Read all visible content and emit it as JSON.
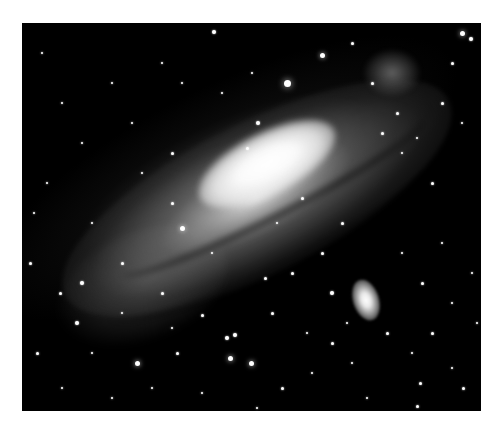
{
  "image": {
    "subject": "spiral galaxy with satellite galaxy, star field",
    "background_color": "#ffffff",
    "sky_color": "#000000",
    "frame": {
      "left": 22,
      "top": 23,
      "width": 459,
      "height": 388
    }
  },
  "galaxy": {
    "core_center": [
      245,
      140
    ],
    "tilt_deg": -27
  },
  "satellite_galaxy": {
    "center": [
      344,
      277
    ],
    "width": 26,
    "height": 42
  },
  "stars": [
    [
      265,
      60,
      7
    ],
    [
      300,
      32,
      5
    ],
    [
      192,
      9,
      4
    ],
    [
      330,
      20,
      3
    ],
    [
      440,
      10,
      5
    ],
    [
      449,
      16,
      4
    ],
    [
      430,
      40,
      3
    ],
    [
      420,
      80,
      3
    ],
    [
      360,
      110,
      3
    ],
    [
      380,
      130,
      2
    ],
    [
      410,
      160,
      3
    ],
    [
      440,
      100,
      2
    ],
    [
      236,
      100,
      4
    ],
    [
      150,
      130,
      3
    ],
    [
      120,
      150,
      2
    ],
    [
      60,
      120,
      2
    ],
    [
      40,
      80,
      2
    ],
    [
      90,
      60,
      2
    ],
    [
      140,
      40,
      2
    ],
    [
      20,
      30,
      2
    ],
    [
      12,
      190,
      2
    ],
    [
      8,
      240,
      3
    ],
    [
      60,
      260,
      4
    ],
    [
      38,
      270,
      3
    ],
    [
      100,
      240,
      3
    ],
    [
      160,
      205,
      5
    ],
    [
      150,
      180,
      3
    ],
    [
      140,
      270,
      3
    ],
    [
      55,
      300,
      4
    ],
    [
      15,
      330,
      3
    ],
    [
      115,
      340,
      5
    ],
    [
      155,
      330,
      3
    ],
    [
      150,
      305,
      2
    ],
    [
      180,
      292,
      3
    ],
    [
      205,
      315,
      4
    ],
    [
      213,
      312,
      4
    ],
    [
      208,
      335,
      5
    ],
    [
      229,
      340,
      5
    ],
    [
      250,
      290,
      3
    ],
    [
      243,
      255,
      3
    ],
    [
      270,
      250,
      3
    ],
    [
      300,
      230,
      3
    ],
    [
      320,
      200,
      3
    ],
    [
      310,
      320,
      3
    ],
    [
      260,
      365,
      3
    ],
    [
      180,
      370,
      2
    ],
    [
      90,
      375,
      2
    ],
    [
      40,
      365,
      2
    ],
    [
      290,
      350,
      2
    ],
    [
      330,
      340,
      2
    ],
    [
      390,
      330,
      2
    ],
    [
      410,
      310,
      3
    ],
    [
      430,
      280,
      2
    ],
    [
      450,
      250,
      2
    ],
    [
      400,
      260,
      3
    ],
    [
      380,
      230,
      2
    ],
    [
      420,
      220,
      2
    ],
    [
      455,
      300,
      2
    ],
    [
      398,
      360,
      3
    ],
    [
      441,
      365,
      3
    ],
    [
      430,
      345,
      2
    ],
    [
      395,
      383,
      3
    ],
    [
      310,
      270,
      4
    ],
    [
      160,
      60,
      2
    ],
    [
      200,
      70,
      2
    ],
    [
      230,
      50,
      2
    ],
    [
      110,
      100,
      2
    ],
    [
      70,
      200,
      2
    ],
    [
      25,
      160,
      2
    ],
    [
      350,
      60,
      3
    ],
    [
      375,
      90,
      3
    ],
    [
      395,
      115,
      2
    ],
    [
      225,
      125,
      3
    ],
    [
      280,
      175,
      3
    ],
    [
      255,
      200,
      2
    ],
    [
      190,
      230,
      2
    ],
    [
      100,
      290,
      2
    ],
    [
      70,
      330,
      2
    ],
    [
      130,
      365,
      2
    ],
    [
      235,
      385,
      2
    ],
    [
      345,
      375,
      2
    ],
    [
      365,
      310,
      3
    ],
    [
      325,
      300,
      2
    ],
    [
      285,
      310,
      2
    ]
  ]
}
